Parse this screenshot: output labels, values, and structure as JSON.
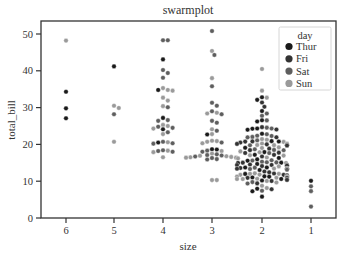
{
  "chart_data": {
    "type": "scatter",
    "subtype": "swarmplot",
    "title": "swarmplot",
    "xlabel": "size",
    "ylabel": "total_bill",
    "categories": [
      "6",
      "5",
      "4",
      "3",
      "2",
      "1"
    ],
    "yticks": [
      0,
      10,
      20,
      30,
      40,
      50
    ],
    "ylim": [
      0,
      53
    ],
    "grid": false,
    "legend": {
      "title": "day",
      "position": "upper right",
      "entries": [
        {
          "label": "Thur",
          "color": "#1a1a1a"
        },
        {
          "label": "Fri",
          "color": "#333333"
        },
        {
          "label": "Sat",
          "color": "#5e5e5e"
        },
        {
          "label": "Sun",
          "color": "#9a9a9a"
        }
      ]
    },
    "series": [
      {
        "category": "6",
        "points": [
          {
            "y": 48.2,
            "day": "Sun"
          },
          {
            "y": 34.3,
            "day": "Thur"
          },
          {
            "y": 29.8,
            "day": "Thur"
          },
          {
            "y": 27.1,
            "day": "Thur"
          }
        ]
      },
      {
        "category": "5",
        "points": [
          {
            "y": 41.2,
            "day": "Thur"
          },
          {
            "y": 30.5,
            "day": "Sun"
          },
          {
            "y": 29.9,
            "day": "Sun"
          },
          {
            "y": 28.2,
            "day": "Sat"
          },
          {
            "y": 20.7,
            "day": "Sun"
          }
        ]
      },
      {
        "category": "4",
        "points": [
          {
            "y": 48.3,
            "day": "Sat"
          },
          {
            "y": 48.3,
            "day": "Sat"
          },
          {
            "y": 43.1,
            "day": "Thur"
          },
          {
            "y": 40.2,
            "day": "Sat"
          },
          {
            "y": 39.4,
            "day": "Sat"
          },
          {
            "y": 38.1,
            "day": "Sat"
          },
          {
            "y": 35.3,
            "day": "Sun"
          },
          {
            "y": 34.8,
            "day": "Sun"
          },
          {
            "y": 34.6,
            "day": "Sun"
          },
          {
            "y": 34.8,
            "day": "Thur"
          },
          {
            "y": 32.7,
            "day": "Sun"
          },
          {
            "y": 31.9,
            "day": "Sun"
          },
          {
            "y": 30.1,
            "day": "Sat"
          },
          {
            "y": 30.4,
            "day": "Sun"
          },
          {
            "y": 27.2,
            "day": "Thur"
          },
          {
            "y": 26.6,
            "day": "Sat"
          },
          {
            "y": 26.4,
            "day": "Sat"
          },
          {
            "y": 25.0,
            "day": "Sun"
          },
          {
            "y": 24.8,
            "day": "Sat"
          },
          {
            "y": 24.3,
            "day": "Sun"
          },
          {
            "y": 24.1,
            "day": "Thur"
          },
          {
            "y": 25.3,
            "day": "Sun"
          },
          {
            "y": 24.5,
            "day": "Sat"
          },
          {
            "y": 23.3,
            "day": "Sat"
          },
          {
            "y": 22.8,
            "day": "Sun"
          },
          {
            "y": 20.7,
            "day": "Sat"
          },
          {
            "y": 20.5,
            "day": "Thur"
          },
          {
            "y": 20.6,
            "day": "Sun"
          },
          {
            "y": 20.3,
            "day": "Sat"
          },
          {
            "y": 20.2,
            "day": "Sat"
          },
          {
            "y": 18.4,
            "day": "Sat"
          },
          {
            "y": 18.3,
            "day": "Sun"
          },
          {
            "y": 18.2,
            "day": "Sat"
          },
          {
            "y": 18.0,
            "day": "Sat"
          },
          {
            "y": 17.9,
            "day": "Sun"
          },
          {
            "y": 16.5,
            "day": "Sun"
          }
        ]
      },
      {
        "category": "3",
        "points": [
          {
            "y": 50.8,
            "day": "Sat"
          },
          {
            "y": 45.4,
            "day": "Sun"
          },
          {
            "y": 44.3,
            "day": "Sat"
          },
          {
            "y": 38.0,
            "day": "Sun"
          },
          {
            "y": 35.8,
            "day": "Sat"
          },
          {
            "y": 31.3,
            "day": "Sat"
          },
          {
            "y": 30.5,
            "day": "Sat"
          },
          {
            "y": 29.0,
            "day": "Sat"
          },
          {
            "y": 28.4,
            "day": "Sun"
          },
          {
            "y": 28.2,
            "day": "Sat"
          },
          {
            "y": 28.6,
            "day": "Sun"
          },
          {
            "y": 26.4,
            "day": "Sat"
          },
          {
            "y": 25.9,
            "day": "Sat"
          },
          {
            "y": 24.1,
            "day": "Sun"
          },
          {
            "y": 23.7,
            "day": "Sat"
          },
          {
            "y": 22.8,
            "day": "Sun"
          },
          {
            "y": 22.7,
            "day": "Thur"
          },
          {
            "y": 20.7,
            "day": "Sun"
          },
          {
            "y": 20.9,
            "day": "Sun"
          },
          {
            "y": 20.5,
            "day": "Sat"
          },
          {
            "y": 20.3,
            "day": "Sun"
          },
          {
            "y": 21.0,
            "day": "Sun"
          },
          {
            "y": 18.7,
            "day": "Thur"
          },
          {
            "y": 18.6,
            "day": "Thur"
          },
          {
            "y": 18.3,
            "day": "Sat"
          },
          {
            "y": 18.2,
            "day": "Sun"
          },
          {
            "y": 18.0,
            "day": "Sat"
          },
          {
            "y": 17.5,
            "day": "Sun"
          },
          {
            "y": 17.3,
            "day": "Sat"
          },
          {
            "y": 17.0,
            "day": "Sat"
          },
          {
            "y": 16.9,
            "day": "Sun"
          },
          {
            "y": 16.6,
            "day": "Sun"
          },
          {
            "y": 16.5,
            "day": "Sun"
          },
          {
            "y": 16.3,
            "day": "Sat"
          },
          {
            "y": 16.0,
            "day": "Sat"
          },
          {
            "y": 16.2,
            "day": "Sun"
          },
          {
            "y": 16.4,
            "day": "Sun"
          },
          {
            "y": 16.7,
            "day": "Sat"
          },
          {
            "y": 16.8,
            "day": "Sun"
          },
          {
            "y": 17.1,
            "day": "Sat"
          },
          {
            "y": 16.4,
            "day": "Sun"
          },
          {
            "y": 15.9,
            "day": "Sat"
          },
          {
            "y": 10.3,
            "day": "Sun"
          },
          {
            "y": 10.3,
            "day": "Sun"
          }
        ]
      },
      {
        "category": "2",
        "points": "dense",
        "count_estimate": 156,
        "range": [
          5.8,
          40.5
        ],
        "note": "dense cluster mostly 9-24, mixed days"
      },
      {
        "category": "1",
        "points": [
          {
            "y": 10.1,
            "day": "Thur"
          },
          {
            "y": 8.6,
            "day": "Sat"
          },
          {
            "y": 7.3,
            "day": "Sat"
          },
          {
            "y": 3.1,
            "day": "Sat"
          }
        ]
      }
    ]
  },
  "title": "swarmplot",
  "axes": {
    "xlabel": "size",
    "ylabel": "total_bill",
    "xticks": [
      "6",
      "5",
      "4",
      "3",
      "2",
      "1"
    ],
    "yticks": [
      "0",
      "10",
      "20",
      "30",
      "40",
      "50"
    ]
  },
  "legend": {
    "title": "day",
    "items": [
      {
        "label": "Thur",
        "color": "#1a1a1a"
      },
      {
        "label": "Fri",
        "color": "#333333"
      },
      {
        "label": "Sat",
        "color": "#5e5e5e"
      },
      {
        "label": "Sun",
        "color": "#9a9a9a"
      }
    ]
  }
}
